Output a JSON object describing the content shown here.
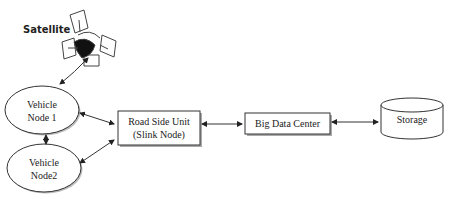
{
  "satellite": {
    "label": "Satellite"
  },
  "nodes": {
    "vehicle1": {
      "line1": "Vehicle",
      "line2": "Node 1"
    },
    "vehicle2": {
      "line1": "Vehicle",
      "line2": "Node2"
    },
    "rsu": {
      "line1": "Road Side Unit",
      "line2": "(Slink Node)"
    },
    "bigdata": {
      "label": "Big Data Center"
    },
    "storage": {
      "label": "Storage"
    }
  },
  "colors": {
    "stroke": "#333333",
    "shadow": "#9a9a9a",
    "fill": "#ffffff"
  }
}
